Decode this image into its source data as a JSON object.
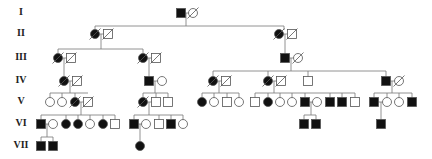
{
  "colors": {
    "line": "#777777",
    "affected": "#111111",
    "unaffected": "#ffffff",
    "stroke": "#555555"
  },
  "generations": [
    {
      "label": "I",
      "y": 13
    },
    {
      "label": "II",
      "y": 34
    },
    {
      "label": "III",
      "y": 58
    },
    {
      "label": "IV",
      "y": 81
    },
    {
      "label": "V",
      "y": 102
    },
    {
      "label": "VI",
      "y": 124
    },
    {
      "label": "VII",
      "y": 146
    }
  ],
  "individuals": [
    {
      "id": "I-1",
      "sex": "M",
      "x": 181,
      "y": 13,
      "affected": true,
      "deceased": false
    },
    {
      "id": "I-2",
      "sex": "F",
      "x": 193,
      "y": 13,
      "affected": false,
      "deceased": true
    },
    {
      "id": "II-1",
      "sex": "F",
      "x": 95,
      "y": 34,
      "affected": true,
      "deceased": true
    },
    {
      "id": "II-2",
      "sex": "M",
      "x": 108,
      "y": 34,
      "affected": false,
      "deceased": true
    },
    {
      "id": "II-3",
      "sex": "F",
      "x": 279,
      "y": 34,
      "affected": true,
      "deceased": true
    },
    {
      "id": "II-4",
      "sex": "M",
      "x": 292,
      "y": 34,
      "affected": false,
      "deceased": true
    },
    {
      "id": "III-1",
      "sex": "F",
      "x": 58,
      "y": 58,
      "affected": true,
      "deceased": true
    },
    {
      "id": "III-2",
      "sex": "M",
      "x": 71,
      "y": 58,
      "affected": false,
      "deceased": true
    },
    {
      "id": "III-3",
      "sex": "F",
      "x": 143,
      "y": 58,
      "affected": true,
      "deceased": true
    },
    {
      "id": "III-4",
      "sex": "M",
      "x": 156,
      "y": 58,
      "affected": false,
      "deceased": true
    },
    {
      "id": "III-5",
      "sex": "M",
      "x": 285,
      "y": 58,
      "affected": true,
      "deceased": false
    },
    {
      "id": "III-6",
      "sex": "F",
      "x": 298,
      "y": 58,
      "affected": false,
      "deceased": true
    },
    {
      "id": "IV-1",
      "sex": "F",
      "x": 64,
      "y": 81,
      "affected": true,
      "deceased": true
    },
    {
      "id": "IV-2",
      "sex": "M",
      "x": 77,
      "y": 81,
      "affected": false,
      "deceased": true
    },
    {
      "id": "IV-3",
      "sex": "M",
      "x": 149,
      "y": 81,
      "affected": true,
      "deceased": false
    },
    {
      "id": "IV-4",
      "sex": "F",
      "x": 162,
      "y": 81,
      "affected": false,
      "deceased": false
    },
    {
      "id": "IV-5",
      "sex": "F",
      "x": 213,
      "y": 81,
      "affected": true,
      "deceased": true
    },
    {
      "id": "IV-6",
      "sex": "M",
      "x": 226,
      "y": 81,
      "affected": false,
      "deceased": true
    },
    {
      "id": "IV-7",
      "sex": "F",
      "x": 268,
      "y": 81,
      "affected": true,
      "deceased": true
    },
    {
      "id": "IV-8",
      "sex": "M",
      "x": 281,
      "y": 81,
      "affected": false,
      "deceased": true
    },
    {
      "id": "IV-9",
      "sex": "M",
      "x": 308,
      "y": 81,
      "affected": false,
      "deceased": false
    },
    {
      "id": "IV-10",
      "sex": "M",
      "x": 386,
      "y": 81,
      "affected": true,
      "deceased": false
    },
    {
      "id": "IV-11",
      "sex": "F",
      "x": 399,
      "y": 81,
      "affected": false,
      "deceased": true
    },
    {
      "id": "V-1",
      "sex": "F",
      "x": 50,
      "y": 102,
      "affected": false,
      "deceased": false
    },
    {
      "id": "V-2",
      "sex": "F",
      "x": 62,
      "y": 102,
      "affected": false,
      "deceased": false
    },
    {
      "id": "V-3",
      "sex": "F",
      "x": 75,
      "y": 102,
      "affected": true,
      "deceased": true
    },
    {
      "id": "V-4",
      "sex": "M",
      "x": 88,
      "y": 102,
      "affected": false,
      "deceased": true
    },
    {
      "id": "V-5",
      "sex": "F",
      "x": 143,
      "y": 102,
      "affected": true,
      "deceased": true
    },
    {
      "id": "V-6",
      "sex": "M",
      "x": 156,
      "y": 102,
      "affected": false,
      "deceased": false
    },
    {
      "id": "V-7",
      "sex": "M",
      "x": 168,
      "y": 102,
      "affected": false,
      "deceased": false
    },
    {
      "id": "V-8",
      "sex": "F",
      "x": 202,
      "y": 102,
      "affected": true,
      "deceased": false
    },
    {
      "id": "V-9",
      "sex": "F",
      "x": 214,
      "y": 102,
      "affected": false,
      "deceased": false
    },
    {
      "id": "V-10",
      "sex": "M",
      "x": 227,
      "y": 102,
      "affected": false,
      "deceased": false
    },
    {
      "id": "V-11",
      "sex": "F",
      "x": 239,
      "y": 102,
      "affected": false,
      "deceased": false
    },
    {
      "id": "V-12",
      "sex": "M",
      "x": 255,
      "y": 102,
      "affected": false,
      "deceased": false
    },
    {
      "id": "V-13",
      "sex": "F",
      "x": 268,
      "y": 102,
      "affected": true,
      "deceased": false
    },
    {
      "id": "V-14",
      "sex": "F",
      "x": 280,
      "y": 102,
      "affected": false,
      "deceased": false
    },
    {
      "id": "V-15",
      "sex": "F",
      "x": 292,
      "y": 102,
      "affected": false,
      "deceased": false
    },
    {
      "id": "V-16",
      "sex": "M",
      "x": 305,
      "y": 102,
      "affected": true,
      "deceased": false
    },
    {
      "id": "V-17",
      "sex": "F",
      "x": 317,
      "y": 102,
      "affected": false,
      "deceased": false
    },
    {
      "id": "V-18",
      "sex": "M",
      "x": 330,
      "y": 102,
      "affected": true,
      "deceased": false
    },
    {
      "id": "V-19",
      "sex": "M",
      "x": 342,
      "y": 102,
      "affected": true,
      "deceased": false
    },
    {
      "id": "V-20",
      "sex": "M",
      "x": 355,
      "y": 102,
      "affected": false,
      "deceased": false
    },
    {
      "id": "V-21",
      "sex": "M",
      "x": 374,
      "y": 102,
      "affected": true,
      "deceased": false
    },
    {
      "id": "V-22",
      "sex": "F",
      "x": 387,
      "y": 102,
      "affected": false,
      "deceased": false
    },
    {
      "id": "V-23",
      "sex": "F",
      "x": 399,
      "y": 102,
      "affected": false,
      "deceased": false
    },
    {
      "id": "V-24",
      "sex": "M",
      "x": 412,
      "y": 102,
      "affected": true,
      "deceased": false
    },
    {
      "id": "VI-1",
      "sex": "M",
      "x": 41,
      "y": 124,
      "affected": true,
      "deceased": false
    },
    {
      "id": "VI-2",
      "sex": "F",
      "x": 53,
      "y": 124,
      "affected": false,
      "deceased": false
    },
    {
      "id": "VI-3",
      "sex": "F",
      "x": 66,
      "y": 124,
      "affected": true,
      "deceased": false
    },
    {
      "id": "VI-4",
      "sex": "F",
      "x": 78,
      "y": 124,
      "affected": true,
      "deceased": false
    },
    {
      "id": "VI-5",
      "sex": "F",
      "x": 90,
      "y": 124,
      "affected": false,
      "deceased": false
    },
    {
      "id": "VI-6",
      "sex": "F",
      "x": 103,
      "y": 124,
      "affected": true,
      "deceased": false
    },
    {
      "id": "VI-7",
      "sex": "M",
      "x": 115,
      "y": 124,
      "affected": false,
      "deceased": false
    },
    {
      "id": "VI-8",
      "sex": "M",
      "x": 134,
      "y": 124,
      "affected": true,
      "deceased": false
    },
    {
      "id": "VI-9",
      "sex": "F",
      "x": 146,
      "y": 124,
      "affected": false,
      "deceased": false
    },
    {
      "id": "VI-10",
      "sex": "M",
      "x": 159,
      "y": 124,
      "affected": false,
      "deceased": false
    },
    {
      "id": "VI-11",
      "sex": "M",
      "x": 171,
      "y": 124,
      "affected": true,
      "deceased": false
    },
    {
      "id": "VI-12",
      "sex": "F",
      "x": 183,
      "y": 124,
      "affected": false,
      "deceased": false
    },
    {
      "id": "VI-13",
      "sex": "M",
      "x": 304,
      "y": 124,
      "affected": true,
      "deceased": false
    },
    {
      "id": "VI-14",
      "sex": "M",
      "x": 316,
      "y": 124,
      "affected": true,
      "deceased": false
    },
    {
      "id": "VI-15",
      "sex": "M",
      "x": 381,
      "y": 124,
      "affected": true,
      "deceased": false
    },
    {
      "id": "VII-1",
      "sex": "M",
      "x": 41,
      "y": 146,
      "affected": true,
      "deceased": false
    },
    {
      "id": "VII-2",
      "sex": "M",
      "x": 53,
      "y": 146,
      "affected": true,
      "deceased": false
    },
    {
      "id": "VII-3",
      "sex": "F",
      "x": 140,
      "y": 146,
      "affected": true,
      "deceased": false
    }
  ],
  "lines": [
    [
      186,
      13,
      186,
      26
    ],
    [
      95,
      26,
      284,
      26
    ],
    [
      95,
      26,
      95,
      30
    ],
    [
      284,
      26,
      284,
      30
    ],
    [
      101,
      34,
      101,
      49
    ],
    [
      58,
      49,
      143,
      49
    ],
    [
      58,
      49,
      58,
      54
    ],
    [
      143,
      49,
      143,
      54
    ],
    [
      285,
      34,
      285,
      54
    ],
    [
      64,
      58,
      64,
      77
    ],
    [
      149,
      58,
      149,
      77
    ],
    [
      291,
      58,
      291,
      71
    ],
    [
      213,
      71,
      386,
      71
    ],
    [
      213,
      71,
      213,
      77
    ],
    [
      268,
      71,
      268,
      77
    ],
    [
      308,
      71,
      308,
      77
    ],
    [
      386,
      71,
      386,
      77
    ],
    [
      70,
      81,
      70,
      93
    ],
    [
      50,
      93,
      88,
      93
    ],
    [
      50,
      93,
      50,
      98
    ],
    [
      62,
      93,
      62,
      98
    ],
    [
      75,
      93,
      75,
      98
    ],
    [
      155,
      81,
      155,
      93
    ],
    [
      143,
      93,
      168,
      93
    ],
    [
      143,
      93,
      143,
      98
    ],
    [
      156,
      93,
      156,
      98
    ],
    [
      168,
      93,
      168,
      98
    ],
    [
      219,
      81,
      219,
      93
    ],
    [
      202,
      93,
      239,
      93
    ],
    [
      202,
      93,
      202,
      98
    ],
    [
      214,
      93,
      214,
      98
    ],
    [
      227,
      93,
      227,
      98
    ],
    [
      239,
      93,
      239,
      98
    ],
    [
      274,
      81,
      274,
      93
    ],
    [
      255,
      93,
      355,
      93
    ],
    [
      255,
      93,
      255,
      98
    ],
    [
      268,
      93,
      268,
      98
    ],
    [
      280,
      93,
      280,
      98
    ],
    [
      292,
      93,
      292,
      98
    ],
    [
      305,
      93,
      305,
      98
    ],
    [
      330,
      93,
      330,
      98
    ],
    [
      342,
      93,
      342,
      98
    ],
    [
      355,
      93,
      355,
      98
    ],
    [
      392,
      81,
      392,
      93
    ],
    [
      374,
      93,
      412,
      93
    ],
    [
      374,
      93,
      374,
      98
    ],
    [
      387,
      93,
      387,
      98
    ],
    [
      399,
      93,
      399,
      98
    ],
    [
      412,
      93,
      412,
      98
    ],
    [
      81,
      102,
      81,
      115
    ],
    [
      41,
      115,
      115,
      115
    ],
    [
      41,
      115,
      41,
      120
    ],
    [
      66,
      115,
      66,
      120
    ],
    [
      78,
      115,
      78,
      120
    ],
    [
      90,
      115,
      90,
      120
    ],
    [
      103,
      115,
      103,
      120
    ],
    [
      115,
      115,
      115,
      120
    ],
    [
      149,
      102,
      149,
      115
    ],
    [
      134,
      115,
      183,
      115
    ],
    [
      134,
      115,
      134,
      120
    ],
    [
      159,
      115,
      159,
      120
    ],
    [
      171,
      115,
      171,
      120
    ],
    [
      183,
      115,
      183,
      120
    ],
    [
      311,
      102,
      311,
      115
    ],
    [
      304,
      115,
      316,
      115
    ],
    [
      304,
      115,
      304,
      120
    ],
    [
      316,
      115,
      316,
      120
    ],
    [
      381,
      102,
      381,
      120
    ],
    [
      47,
      124,
      47,
      137
    ],
    [
      41,
      137,
      53,
      137
    ],
    [
      41,
      137,
      41,
      142
    ],
    [
      53,
      137,
      53,
      142
    ],
    [
      140,
      124,
      140,
      142
    ]
  ],
  "couple_lines": [
    [
      181,
      193,
      13
    ],
    [
      95,
      108,
      34
    ],
    [
      279,
      292,
      34
    ],
    [
      58,
      71,
      58
    ],
    [
      143,
      156,
      58
    ],
    [
      285,
      298,
      58
    ],
    [
      64,
      77,
      81
    ],
    [
      149,
      162,
      81
    ],
    [
      213,
      226,
      81
    ],
    [
      268,
      281,
      81
    ],
    [
      386,
      399,
      81
    ],
    [
      75,
      88,
      102
    ],
    [
      143,
      156,
      102
    ],
    [
      305,
      317,
      102
    ],
    [
      374,
      387,
      102
    ],
    [
      41,
      53,
      124
    ],
    [
      134,
      146,
      124
    ]
  ]
}
